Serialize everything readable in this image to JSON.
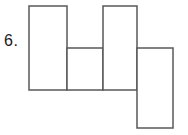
{
  "problem": {
    "number_label": "6."
  },
  "figure": {
    "canvas": {
      "width": 188,
      "height": 135
    },
    "stroke_color": "#58585a",
    "fill_color": "#ffffff",
    "stroke_width": 1.5,
    "rects": [
      {
        "name": "left-tall-rect",
        "x": 29,
        "y": 6,
        "width": 38,
        "height": 84
      },
      {
        "name": "middle-short-rect",
        "x": 67,
        "y": 48,
        "width": 36,
        "height": 42
      },
      {
        "name": "right-tall-rect",
        "x": 103,
        "y": 6,
        "width": 34,
        "height": 84
      },
      {
        "name": "far-right-low-rect",
        "x": 137,
        "y": 48,
        "width": 36,
        "height": 80
      }
    ]
  }
}
